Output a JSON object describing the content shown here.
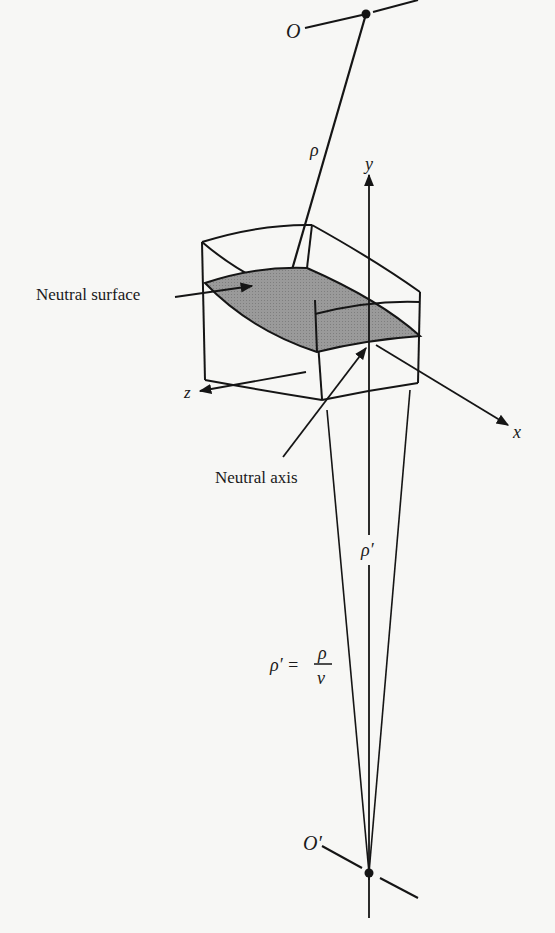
{
  "figure": {
    "labels": {
      "center_top": "O",
      "center_bottom": "O′",
      "rho": "ρ",
      "rho_prime": "ρ′",
      "y_axis": "y",
      "x_axis": "x",
      "z_axis": "z",
      "neutral_surface": "Neutral surface",
      "neutral_axis": "Neutral axis",
      "equation_lhs": "ρ′ =",
      "equation_num": "ρ",
      "equation_den": "ν"
    },
    "colors": {
      "line": "#151515",
      "surface_fill": "#9a9a9a",
      "background": "#f7f7f5"
    }
  }
}
